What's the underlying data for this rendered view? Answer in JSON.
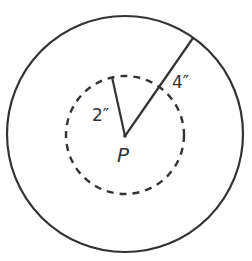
{
  "diagram": {
    "center_label": "P",
    "inner_radius_label": "2″",
    "outer_radius_label": "4″",
    "inner_circle": {
      "style": "dashed",
      "radius_in": 2
    },
    "outer_circle": {
      "style": "solid",
      "radius_in": 4
    },
    "stroke_color": "#333333"
  }
}
